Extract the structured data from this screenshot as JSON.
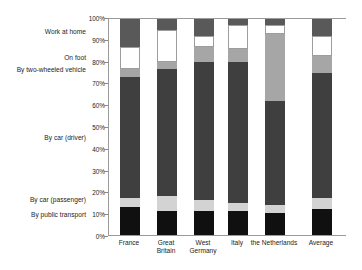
{
  "chart_data": {
    "type": "bar",
    "subtype": "stacked-percent",
    "title": "",
    "xlabel": "",
    "ylabel": "",
    "ylim": [
      0,
      100
    ],
    "ytick_labels": [
      "0%",
      "10%",
      "20%",
      "30%",
      "40%",
      "50%",
      "60%",
      "70%",
      "80%",
      "90%",
      "100%"
    ],
    "ytick_values": [
      0,
      10,
      20,
      30,
      40,
      50,
      60,
      70,
      80,
      90,
      100
    ],
    "grid": false,
    "legend_position": "left-outside-as-category-labels",
    "categories": [
      "France",
      "Great Britain",
      "West Germany",
      "Italy",
      "the Netherlands",
      "Average"
    ],
    "series": [
      {
        "name": "By public transport",
        "color": "#101010",
        "values": [
          13,
          11,
          11,
          11,
          10,
          12
        ]
      },
      {
        "name": "By car (passenger)",
        "color": "#d3d3d3",
        "values": [
          4,
          7,
          5,
          4,
          4,
          5
        ]
      },
      {
        "name": "By car (driver)",
        "color": "#3f3f3f",
        "values": [
          56,
          59,
          64,
          65,
          48,
          58
        ]
      },
      {
        "name": "By two-wheeled vehicle",
        "color": "#a6a6a6",
        "values": [
          4,
          3,
          7,
          6,
          31,
          8
        ]
      },
      {
        "name": "On foot",
        "color": "#ffffff",
        "values": [
          10,
          15,
          5,
          11,
          4,
          9
        ]
      },
      {
        "name": "Work at home",
        "color": "#595959",
        "values": [
          13,
          5,
          8,
          3,
          3,
          8
        ]
      }
    ]
  },
  "axis": {
    "category_label_order_top_to_bottom": [
      "Work at home",
      "On foot",
      "By two-wheeled vehicle",
      "By car (driver)",
      "By car (passenger)",
      "By public transport"
    ]
  }
}
